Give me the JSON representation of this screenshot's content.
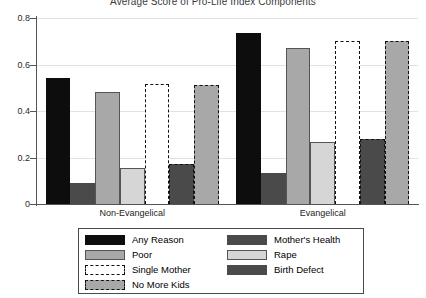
{
  "chart_data": {
    "type": "bar",
    "title": "Average Score of Pro-Life Index Components",
    "xlabel": "",
    "ylabel": "",
    "ylim": [
      0,
      0.8
    ],
    "yticks": [
      "0",
      "0.2",
      "0.4",
      "0.6",
      "0.8"
    ],
    "ytick_values": [
      0,
      0.2,
      0.4,
      0.6,
      0.8
    ],
    "grid": true,
    "legend_position": "bottom",
    "categories": [
      "Non-Evangelical",
      "Evangelical"
    ],
    "series": [
      {
        "name": "Any Reason",
        "values": [
          0.54,
          0.735
        ],
        "fill": "#0d0d0d",
        "edge": "#0d0d0d",
        "dashed": false
      },
      {
        "name": "Birth Defect",
        "values": [
          0.09,
          0.135
        ],
        "fill": "#4a4a4a",
        "edge": "#4a4a4a",
        "dashed": false
      },
      {
        "name": "Poor",
        "values": [
          0.48,
          0.67
        ],
        "fill": "#a8a8a8",
        "edge": "#555555",
        "dashed": false
      },
      {
        "name": "Rape",
        "values": [
          0.155,
          0.265
        ],
        "fill": "#d6d6d6",
        "edge": "#555555",
        "dashed": false
      },
      {
        "name": "Single Mother",
        "values": [
          0.515,
          0.7
        ],
        "fill": "#ffffff",
        "edge": "#111111",
        "dashed": true
      },
      {
        "name": "Mother's Health",
        "values": [
          0.17,
          0.28
        ],
        "fill": "#4a4a4a",
        "edge": "#111111",
        "dashed": true
      },
      {
        "name": "No More Kids",
        "values": [
          0.51,
          0.7
        ],
        "fill": "#a8a8a8",
        "edge": "#111111",
        "dashed": true
      }
    ]
  },
  "legend": {
    "left_column": [
      {
        "label": "Any Reason",
        "swatch": "solid-black"
      },
      {
        "label": "Poor",
        "swatch": "solid-gray"
      },
      {
        "label": "Single Mother",
        "swatch": "dashed-white"
      },
      {
        "label": "No More Kids",
        "swatch": "dashed-gray"
      }
    ],
    "right_column": [
      {
        "label": "Mother's Health",
        "swatch": "solid-darkgray"
      },
      {
        "label": "Rape",
        "swatch": "solid-lightgray"
      },
      {
        "label": "Birth Defect",
        "swatch": "solid-darkgray"
      }
    ]
  },
  "colors": {
    "black": "#0d0d0d",
    "dark_gray": "#4a4a4a",
    "mid_gray": "#a8a8a8",
    "light_gray": "#d6d6d6",
    "white": "#ffffff",
    "axis": "#555555",
    "grid": "#e2e2e2"
  }
}
